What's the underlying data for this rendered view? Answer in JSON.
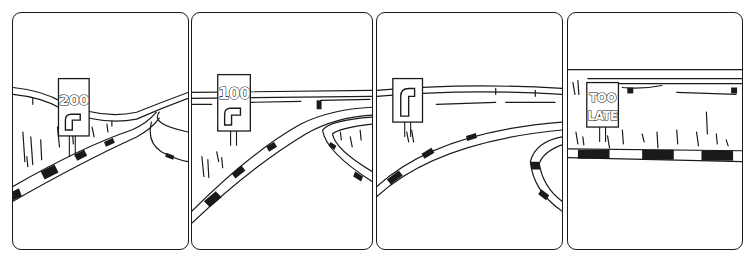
{
  "comic": {
    "panel_count": 4,
    "ink_color": "#1a1a1a",
    "background_color": "#ffffff",
    "panels": [
      {
        "index": 1,
        "sign_text": "200",
        "sign_symbol": "right-turn-arrow",
        "scene": "road curving right with checkered kerb, guardrail on horizon"
      },
      {
        "index": 2,
        "sign_text": "100",
        "sign_symbol": "right-turn-arrow",
        "scene": "closer to curve, checkered kerb on both sides"
      },
      {
        "index": 3,
        "sign_text": "",
        "sign_symbol": "right-turn-arrow",
        "scene": "sign at the bend, road turning sharply right"
      },
      {
        "index": 4,
        "sign_text_lines": [
          "TOO",
          "LATE"
        ],
        "sign_symbol": "",
        "scene": "road edge seen head-on, straight kerb, grass and guardrail behind"
      }
    ]
  }
}
